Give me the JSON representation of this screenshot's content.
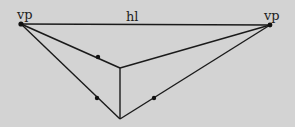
{
  "diagram": {
    "colors": {
      "background": "#d3d3d3",
      "line": "#1a1a1a"
    },
    "labels": {
      "vp_left": "vp",
      "vp_right": "vp",
      "horizon": "hl"
    },
    "points": {
      "vp_left": [
        21,
        24
      ],
      "vp_right": [
        270,
        25
      ],
      "top_corner": [
        120,
        68
      ],
      "bottom_corner": [
        120,
        119
      ]
    },
    "markers": [
      {
        "name": "marker-left-upper",
        "at": [
          98,
          57
        ]
      },
      {
        "name": "marker-left-lower",
        "at": [
          97,
          98
        ]
      },
      {
        "name": "marker-right-lower",
        "at": [
          154,
          98
        ]
      }
    ]
  }
}
